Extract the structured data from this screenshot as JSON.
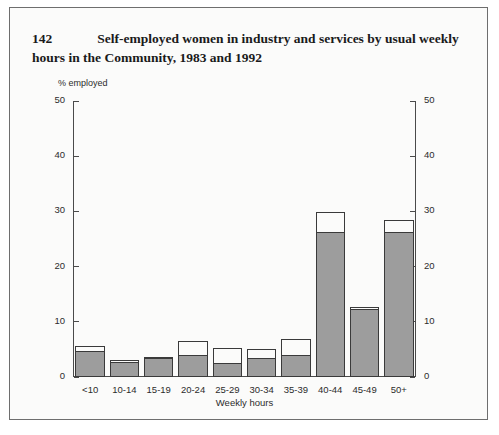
{
  "figure": {
    "number": "142",
    "title": "Self-employed women in industry and services by usual weekly hours in the Community, 1983 and 1992",
    "unit_label": "% employed"
  },
  "legend": {
    "items": [
      {
        "label": "1983",
        "swatch": "filled-gray-swatch",
        "color": "#9d9d9d"
      },
      {
        "label": "1992",
        "swatch": "open-white-swatch",
        "color": "#fbfbfa"
      }
    ],
    "note": "P 1986, E 1987, NL 1991"
  },
  "axes": {
    "left_ticks": [
      "0",
      "10",
      "20",
      "30",
      "40",
      "50"
    ],
    "right_ticks": [
      "0",
      "10",
      "20",
      "30",
      "40",
      "50"
    ],
    "x_title": "Weekly hours"
  },
  "chart_data": {
    "type": "bar",
    "title": "Self-employed women in industry and services by usual weekly hours in the Community, 1983 and 1992",
    "subtitle": "P 1986, E 1987, NL 1991",
    "xlabel": "Weekly hours",
    "ylabel": "% employed",
    "ylim": [
      0,
      50
    ],
    "yticks": [
      0,
      10,
      20,
      30,
      40,
      50
    ],
    "grid": false,
    "legend_position": "upper-left",
    "dual_y_axis": true,
    "categories": [
      "<10",
      "10-14",
      "15-19",
      "20-24",
      "25-29",
      "30-34",
      "35-39",
      "40-44",
      "45-49",
      "50+"
    ],
    "series": [
      {
        "name": "1983",
        "color": "#9d9d9d",
        "values": [
          4.8,
          2.8,
          3.4,
          4.0,
          2.6,
          3.4,
          4.0,
          26.2,
          12.4,
          26.2
        ]
      },
      {
        "name": "1992",
        "color": "#fbfbfa",
        "values": [
          5.6,
          3.0,
          3.6,
          6.5,
          5.2,
          5.0,
          6.9,
          29.9,
          12.6,
          28.5
        ]
      }
    ]
  }
}
